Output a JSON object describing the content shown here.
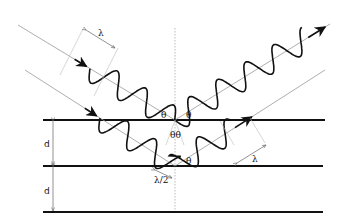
{
  "diagram": {
    "colors": {
      "plane": "#111111",
      "ray": "#999999",
      "wave": "#111111",
      "normal": "#aaaaaa"
    },
    "planes": [
      {
        "id": "plane-1",
        "x1": 43,
        "x2": 325,
        "y": 120
      },
      {
        "id": "plane-2",
        "x1": 43,
        "x2": 323,
        "y": 166
      },
      {
        "id": "plane-3",
        "x1": 43,
        "x2": 323,
        "y": 212
      }
    ],
    "normal_line": {
      "x": 175,
      "y1": 28,
      "y2": 212
    },
    "rays": [
      {
        "id": "ray-1",
        "incident_start": [
          18,
          25
        ],
        "hit": [
          175,
          120
        ],
        "reflected_end": [
          330,
          24
        ],
        "wave_start": 0.23,
        "wave_end": 0.93,
        "amplitude": 12,
        "wavelength": 33
      },
      {
        "id": "ray-2",
        "incident_start": [
          25,
          70
        ],
        "hit": [
          175,
          166
        ],
        "reflected_end": [
          325,
          70
        ],
        "wave_start": 0.25,
        "wave_end": 0.7,
        "amplitude": 12,
        "wavelength": 33
      }
    ],
    "labels": {
      "lambda_top": "λ",
      "lambda_right": "λ",
      "half_lambda": "λ/2",
      "theta_left": "θ",
      "theta_right": "θ",
      "theta_pair": "θθ",
      "theta_lower": "θ",
      "d_upper": "d",
      "d_lower": "d"
    }
  }
}
